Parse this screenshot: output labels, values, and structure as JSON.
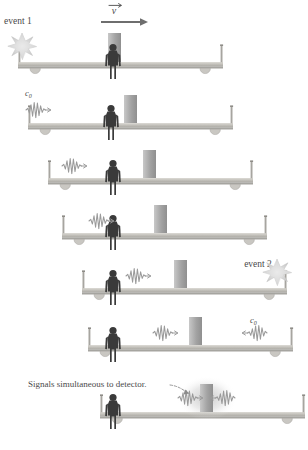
{
  "figure": {
    "background_color": "#ffffff",
    "width": 308,
    "height": 450
  },
  "colors": {
    "cart_deck": "#b5b3ad",
    "cart_deck_light": "#d6d4ce",
    "cart_post": "#a7a5a0",
    "wheel": "#c9c7c2",
    "person": "#3a3a3a",
    "detector_block": "#a0a0a0",
    "detector_block_light": "#c2c2c2",
    "wave": "#9a9a9a",
    "starburst": "#cfcfcf",
    "text": "#4a4a4a",
    "arrow": "#6e6e6e",
    "glow": "#bdbdbd"
  },
  "labels": {
    "event1": "event 1",
    "event2": "event 2",
    "velocity": "v",
    "speed_of_light": "c",
    "speed_of_light_sub": "0",
    "caption": "Signals simultaneous to detector."
  },
  "frames": [
    {
      "index": 1,
      "name": "frame-1-emission",
      "cart_x": 18,
      "cart_y": 62,
      "cart_width": 205,
      "person_offset": 95,
      "block_offset": 95,
      "block_visible": false,
      "annotation": "event 1",
      "annotation_side": "left",
      "starburst": "left",
      "velocity_arrow": true,
      "waves": []
    },
    {
      "index": 2,
      "name": "frame-2-wave-left-start",
      "cart_x": 28,
      "cart_y": 123,
      "cart_width": 205,
      "person_offset": 85,
      "block_offset": 103,
      "block_visible": true,
      "annotation": "c0",
      "annotation_side": "left",
      "starburst": "none",
      "velocity_arrow": false,
      "waves": [
        {
          "x_offset": -2,
          "direction": "right"
        }
      ]
    },
    {
      "index": 3,
      "name": "frame-3-wave-travel",
      "cart_x": 48,
      "cart_y": 178,
      "cart_width": 205,
      "person_offset": 75,
      "block_offset": 112,
      "block_visible": true,
      "annotation": "",
      "annotation_side": "",
      "starburst": "none",
      "velocity_arrow": false,
      "waves": [
        {
          "x_offset": 18,
          "direction": "right"
        }
      ]
    },
    {
      "index": 4,
      "name": "frame-4-wave-reaches-observer",
      "cart_x": 60,
      "cart_y": 233,
      "cart_width": 205,
      "person_offset": 68,
      "block_offset": 120,
      "block_visible": true,
      "annotation": "event 2",
      "annotation_side": "right",
      "starburst": "none",
      "velocity_arrow": false,
      "waves": [
        {
          "x_offset": 42,
          "direction": "right"
        }
      ]
    },
    {
      "index": 5,
      "name": "frame-5-event-2-emission",
      "cart_x": 76,
      "cart_y": 288,
      "cart_width": 205,
      "person_offset": 58,
      "block_offset": 128,
      "block_visible": true,
      "annotation": "c0",
      "annotation_side": "right",
      "starburst": "right",
      "velocity_arrow": false,
      "waves": [
        {
          "x_offset": 68,
          "direction": "right"
        }
      ]
    },
    {
      "index": 6,
      "name": "frame-6-two-waves-converging",
      "cart_x": 88,
      "cart_y": 345,
      "cart_width": 205,
      "person_offset": 48,
      "block_offset": 135,
      "block_visible": true,
      "annotation": "",
      "annotation_side": "",
      "starburst": "none",
      "velocity_arrow": false,
      "waves": [
        {
          "x_offset": 90,
          "direction": "right"
        },
        {
          "x_offset": 172,
          "direction": "left"
        }
      ]
    },
    {
      "index": 7,
      "name": "frame-7-signals-meet",
      "cart_x": 100,
      "cart_y": 412,
      "cart_width": 205,
      "person_offset": 38,
      "block_offset": 128,
      "block_visible": true,
      "annotation": "caption",
      "annotation_side": "left",
      "starburst": "none",
      "velocity_arrow": false,
      "waves": [
        {
          "x_offset": 110,
          "direction": "right"
        },
        {
          "x_offset": 148,
          "direction": "left"
        }
      ]
    }
  ]
}
